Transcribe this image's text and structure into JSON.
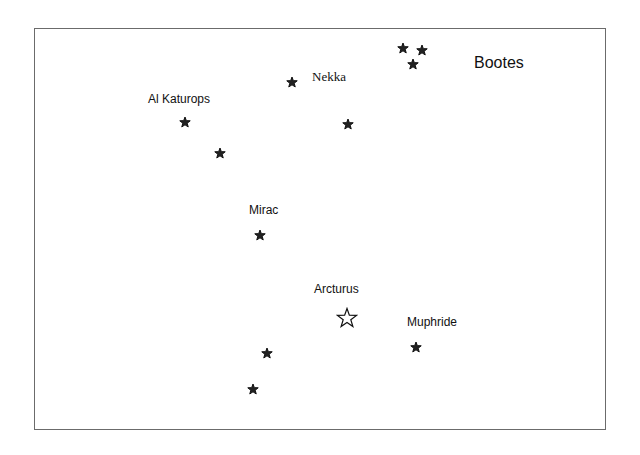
{
  "diagram": {
    "title": "Bootes",
    "frame_color": "#6b6b6b",
    "labels": [
      {
        "text": "Nekka",
        "x": 312,
        "y": 69
      },
      {
        "text": "Al Katurops",
        "x": 148,
        "y": 92
      },
      {
        "text": "Mirac",
        "x": 249,
        "y": 203
      },
      {
        "text": "Arcturus",
        "x": 314,
        "y": 282
      },
      {
        "text": "Muphride",
        "x": 407,
        "y": 315
      }
    ],
    "stars": [
      {
        "name": "nekka",
        "x": 292,
        "y": 80,
        "type": "filled"
      },
      {
        "name": "al-katurops",
        "x": 185,
        "y": 120,
        "type": "filled"
      },
      {
        "name": "unnamed-1",
        "x": 220,
        "y": 151,
        "type": "filled"
      },
      {
        "name": "unnamed-2",
        "x": 348,
        "y": 122,
        "type": "filled"
      },
      {
        "name": "mirac",
        "x": 260,
        "y": 233,
        "type": "filled"
      },
      {
        "name": "trio-1",
        "x": 403,
        "y": 46,
        "type": "filled"
      },
      {
        "name": "trio-2",
        "x": 422,
        "y": 48,
        "type": "filled"
      },
      {
        "name": "trio-3",
        "x": 413,
        "y": 62,
        "type": "filled"
      },
      {
        "name": "arcturus",
        "x": 347,
        "y": 318,
        "type": "hollow"
      },
      {
        "name": "muphride",
        "x": 416,
        "y": 345,
        "type": "filled"
      },
      {
        "name": "unnamed-3",
        "x": 267,
        "y": 351,
        "type": "filled"
      },
      {
        "name": "unnamed-4",
        "x": 253,
        "y": 387,
        "type": "filled"
      }
    ]
  }
}
